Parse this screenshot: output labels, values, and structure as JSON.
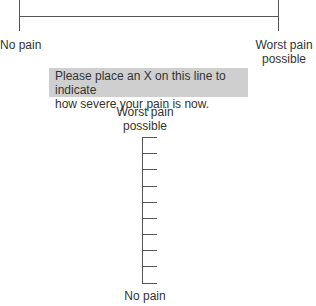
{
  "horizontal_scale": {
    "left_label": "No pain",
    "right_label_line1": "Worst pain",
    "right_label_line2": "possible"
  },
  "instruction": {
    "line1": "Please place an X on this line to indicate",
    "line2": "how severe your pain is now.",
    "background": "#cfcfcf"
  },
  "vertical_scale": {
    "top_label_line1": "Worst pain",
    "top_label_line2": "possible",
    "bottom_label": "No pain",
    "tick_count": 10
  },
  "line_color": "#555555"
}
